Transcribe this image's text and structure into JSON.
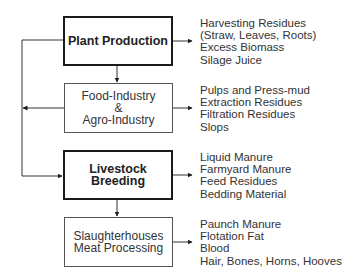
{
  "diagram": {
    "nodes": [
      {
        "id": "plant",
        "label": "Plant Production",
        "style": "bold",
        "outputs": [
          "Harvesting Residues",
          "(Straw, Leaves, Roots)",
          "Excess Biomass",
          "Silage Juice"
        ]
      },
      {
        "id": "food",
        "label": "Food-Industry\n&\nAgro-Industry",
        "style": "normal",
        "outputs": [
          "Pulps and Press-mud",
          "Extraction Residues",
          "Filtration Residues",
          "Slops"
        ]
      },
      {
        "id": "livestock",
        "label": "Livestock Breeding",
        "style": "bold",
        "outputs": [
          "Liquid Manure",
          "Farmyard Manure",
          "Feed Residues",
          "Bedding Material"
        ]
      },
      {
        "id": "slaughter",
        "label": "Slaughterhouses\nMeat Processing",
        "style": "normal",
        "outputs": [
          "Paunch Manure",
          "Flotation Fat",
          "Blood",
          "Hair, Bones, Horns, Hooves"
        ]
      }
    ],
    "edges": [
      {
        "from": "plant",
        "to": "food"
      },
      {
        "from": "plant",
        "to": "livestock"
      },
      {
        "from": "food",
        "to": "livestock"
      },
      {
        "from": "livestock",
        "to": "slaughter"
      }
    ],
    "colors": {
      "line": "#1a1a1a",
      "text": "#333333",
      "background": "#ffffff"
    }
  }
}
